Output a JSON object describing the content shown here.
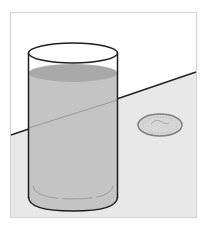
{
  "illustration": {
    "subject": "glass of water beside a coin on a table",
    "colors": {
      "background": "#ffffff",
      "frame_border": "#d4d4d4",
      "wall": "#ffffff",
      "table": "#e8e8e8",
      "table_edge": "#222222",
      "glass_outline": "#1e1e1e",
      "water_body": "#c4c4c4",
      "water_surface": "#a9a9a9",
      "refraction_line": "#9a9a9a",
      "coin_fill": "#d6d6d6",
      "coin_rim": "#808080"
    },
    "objects": [
      "frame",
      "table-surface",
      "glass",
      "water",
      "coin"
    ]
  }
}
